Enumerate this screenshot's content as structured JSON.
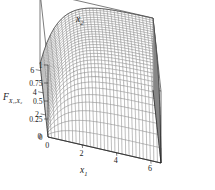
{
  "figure": {
    "kind": "surface-plot",
    "background": "#ffffff",
    "line_color": "#4a4a4a",
    "frame_color": "#111111"
  },
  "chart_data": {
    "type": "line",
    "render": "3d-wireframe-surface",
    "title": "",
    "subtitle": "",
    "xlabel": "x",
    "xlabel_sub": "1",
    "ylabel": "x",
    "ylabel_sub": "2",
    "zlabel": "F",
    "zlabel_sub": "X₁,X₂",
    "xlim": [
      0,
      6.6
    ],
    "ylim": [
      0,
      6.6
    ],
    "zlim": [
      0,
      1
    ],
    "xticks": [
      0,
      2,
      4,
      6
    ],
    "xticklabels": [
      "0",
      "2",
      "4",
      "6"
    ],
    "yticks": [
      0,
      2,
      4,
      6
    ],
    "yticklabels": [
      "0",
      "2",
      "4",
      "6"
    ],
    "zticks": [
      0,
      0.25,
      0.5,
      0.75,
      1
    ],
    "zticklabels": [
      "0",
      "0.25",
      "0.5",
      "0.75",
      "1"
    ],
    "grid": false,
    "legend": "none",
    "mesh_nx": 32,
    "mesh_ny": 32,
    "formula": "F(x1,x2) = (1 - exp(-0.95*x1)) * (1 - exp(-0.95*x2))",
    "z_at_corners": {
      "x0_y0": 0.0,
      "x6_y0": 0.0,
      "x0_y6": 0.0,
      "x6_y6": 0.99
    },
    "sample_points": [
      {
        "x1": 0,
        "x2": 0,
        "F": 0.0
      },
      {
        "x1": 1,
        "x2": 1,
        "F": 0.38
      },
      {
        "x1": 2,
        "x2": 2,
        "F": 0.69
      },
      {
        "x1": 3,
        "x2": 3,
        "F": 0.88
      },
      {
        "x1": 4,
        "x2": 4,
        "F": 0.96
      },
      {
        "x1": 5,
        "x2": 5,
        "F": 0.98
      },
      {
        "x1": 6,
        "x2": 6,
        "F": 0.99
      },
      {
        "x1": 6,
        "x2": 2,
        "F": 0.85
      },
      {
        "x1": 2,
        "x2": 6,
        "F": 0.85
      },
      {
        "x1": 4,
        "x2": 1,
        "F": 0.59
      },
      {
        "x1": 1,
        "x2": 4,
        "F": 0.59
      }
    ]
  },
  "projection": {
    "origin_x": 48,
    "origin_y": 137,
    "x_axis_vec": [
      113,
      26
    ],
    "y_axis_vec": [
      -8,
      -73
    ],
    "z_axis_vec": [
      0,
      -72
    ]
  }
}
